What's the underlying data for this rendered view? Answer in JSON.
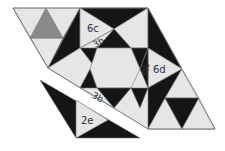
{
  "diagram": {
    "type": "geometric tiling puzzle",
    "colors": {
      "light": "#e6e6e6",
      "dark": "#151515",
      "gray": "#8a8a8a",
      "stroke": "#777777",
      "background": "#ffffff"
    },
    "labels": {
      "piece_6c": "6c",
      "piece_3b_top": "3b",
      "piece_3b_right": "3b",
      "piece_3b_bottom": "3b",
      "piece_6d": "6d",
      "piece_2e": "2e"
    }
  }
}
